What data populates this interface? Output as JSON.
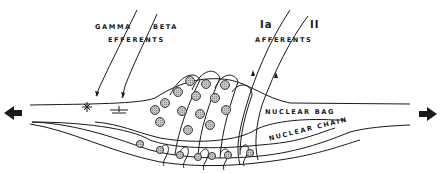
{
  "diagram": {
    "labels": {
      "gamma": "GAMMA",
      "beta": "BETA",
      "efferents": "EFFERENTS",
      "ia": "Ia",
      "ii": "II",
      "afferents": "AFFERENTS",
      "nuclear_bag": "NUCLEAR BAG",
      "nuclear_chain": "NUCLEAR CHAIN"
    },
    "arrows": {
      "left": "left-arrow",
      "right": "right-arrow"
    },
    "colors": {
      "ink": "#1a1a1a",
      "nucleus_fill": "#b0b0b0",
      "background": "#ffffff"
    }
  }
}
